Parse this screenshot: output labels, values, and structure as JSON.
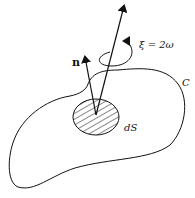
{
  "diagram": {
    "labels": {
      "normal": "n",
      "vorticity": "ξ = 2ω",
      "curve": "C",
      "area_element": "dS"
    },
    "colors": {
      "stroke": "#111111",
      "background": "#ffffff"
    }
  }
}
